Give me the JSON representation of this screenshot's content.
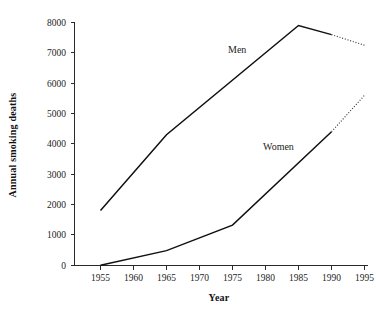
{
  "chart_data": {
    "type": "line",
    "title": "",
    "xlabel": "Year",
    "ylabel": "Annual smoking deaths",
    "xlim": [
      1950,
      1995
    ],
    "ylim": [
      0,
      8000
    ],
    "grid": false,
    "legend_position": "inline-annotation",
    "x_ticks": [
      1955,
      1960,
      1965,
      1970,
      1975,
      1980,
      1985,
      1990,
      1995
    ],
    "x_tick_labels": [
      "1955",
      "1960",
      "1965",
      "1970",
      "1975",
      "1980",
      "1985",
      "1990",
      "1995"
    ],
    "y_ticks": [
      0,
      1000,
      2000,
      3000,
      4000,
      5000,
      6000,
      7000,
      8000
    ],
    "y_tick_labels": [
      "0",
      "1000",
      "2000",
      "3000",
      "4000",
      "5000",
      "6000",
      "7000",
      "8000"
    ],
    "series": [
      {
        "name": "Men",
        "label": "Men",
        "color": "#101010",
        "x": [
          1955,
          1965,
          1985,
          1990
        ],
        "values": [
          1800,
          4300,
          7900,
          7600
        ],
        "style": "solid",
        "projection": {
          "style": "dotted",
          "x": [
            1990,
            1995
          ],
          "values": [
            7600,
            7250
          ]
        },
        "annotation": {
          "text": "Men",
          "x": 1978,
          "y": 7000
        }
      },
      {
        "name": "Women",
        "label": "Women",
        "color": "#101010",
        "x": [
          1955,
          1965,
          1975,
          1990
        ],
        "values": [
          0,
          480,
          1320,
          4400
        ],
        "style": "solid",
        "projection": {
          "style": "dotted",
          "x": [
            1990,
            1995
          ],
          "values": [
            4400,
            5600
          ]
        },
        "annotation": {
          "text": "Women",
          "x": 1983,
          "y": 3900
        }
      }
    ]
  },
  "axes": {
    "x_title": "Year",
    "y_title": "Annual smoking deaths"
  },
  "labels": {
    "men": "Men",
    "women": "Women",
    "y_8000": "8000",
    "y_7000": "7000",
    "y_6000": "6000",
    "y_5000": "5000",
    "y_4000": "4000",
    "y_3000": "3000",
    "y_2000": "2000",
    "y_1000": "1000",
    "y_0": "0",
    "x_1955": "1955",
    "x_1960": "1960",
    "x_1965": "1965",
    "x_1970": "1970",
    "x_1975": "1975",
    "x_1980": "1980",
    "x_1985": "1985",
    "x_1990": "1990",
    "x_1995": "1995"
  }
}
